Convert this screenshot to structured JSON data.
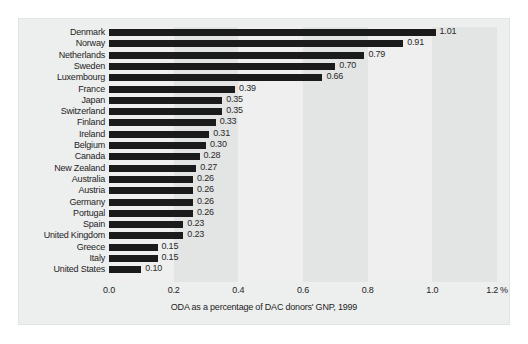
{
  "chart_data": {
    "type": "bar",
    "orientation": "horizontal",
    "title": "",
    "subtitle": "",
    "xlabel": "ODA as a percentage of DAC donors' GNP, 1999",
    "ylabel": "",
    "xlim": [
      0.0,
      1.2
    ],
    "unit": "%",
    "grid": false,
    "legend": null,
    "bands": "alternating vertical shading every 0.2 units",
    "xticks": [
      "0.0",
      "0.2",
      "0.4",
      "0.6",
      "0.8",
      "1.0",
      "1.2"
    ],
    "xtick_values": [
      0.0,
      0.2,
      0.4,
      0.6,
      0.8,
      1.0,
      1.2
    ],
    "xtick_suffix": "%",
    "categories": [
      "Denmark",
      "Norway",
      "Netherlands",
      "Sweden",
      "Luxembourg",
      "France",
      "Japan",
      "Switzerland",
      "Finland",
      "Ireland",
      "Belgium",
      "Canada",
      "New Zealand",
      "Australia",
      "Austria",
      "Germany",
      "Portugal",
      "Spain",
      "United Kingdom",
      "Greece",
      "Italy",
      "United States"
    ],
    "values": [
      1.01,
      0.91,
      0.79,
      0.7,
      0.66,
      0.39,
      0.35,
      0.35,
      0.33,
      0.31,
      0.3,
      0.28,
      0.27,
      0.26,
      0.26,
      0.26,
      0.26,
      0.23,
      0.23,
      0.15,
      0.15,
      0.1
    ],
    "value_labels": [
      "1.01",
      "0.91",
      "0.79",
      "0.70",
      "0.66",
      "0.39",
      "0.35",
      "0.35",
      "0.33",
      "0.31",
      "0.30",
      "0.28",
      "0.27",
      "0.26",
      "0.26",
      "0.26",
      "0.26",
      "0.23",
      "0.23",
      "0.15",
      "0.15",
      "0.10"
    ],
    "colors": {
      "bar": "#1b1b1b",
      "figure_background": "#edeeee",
      "band_light": "#efefef",
      "band_dark": "#e3e4e4",
      "text": "#1d1d1d",
      "page_background": "#ffffff"
    }
  }
}
